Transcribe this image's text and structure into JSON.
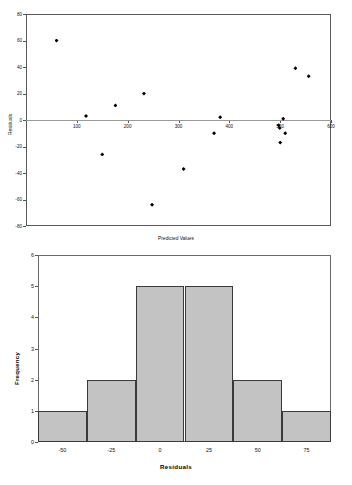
{
  "chart_data": [
    {
      "type": "scatter",
      "title": "",
      "xlabel": "Predicted Values",
      "ylabel": "Residuals",
      "xlim": [
        0,
        600
      ],
      "ylim": [
        -80,
        80
      ],
      "xticks": [
        0,
        100,
        200,
        300,
        400,
        500,
        600
      ],
      "xticklabels": [
        "",
        "100",
        "200",
        "300",
        "400",
        "500",
        "600"
      ],
      "yticks": [
        -80,
        -60,
        -40,
        -20,
        0,
        20,
        40,
        60,
        80
      ],
      "yticklabels": [
        "-80",
        "-60",
        "-40",
        "-20",
        "0",
        "20",
        "40",
        "60",
        "80"
      ],
      "grid": false,
      "legend": "none",
      "marker": "diamond",
      "zero_reference_line": true,
      "points": [
        {
          "x": 60,
          "y": 60
        },
        {
          "x": 118,
          "y": 3
        },
        {
          "x": 150,
          "y": -26
        },
        {
          "x": 176,
          "y": 11
        },
        {
          "x": 232,
          "y": 20
        },
        {
          "x": 248,
          "y": -64
        },
        {
          "x": 310,
          "y": -37
        },
        {
          "x": 370,
          "y": -10
        },
        {
          "x": 382,
          "y": 2
        },
        {
          "x": 497,
          "y": -4
        },
        {
          "x": 499,
          "y": -6
        },
        {
          "x": 506,
          "y": 1
        },
        {
          "x": 500,
          "y": -17
        },
        {
          "x": 510,
          "y": -10
        },
        {
          "x": 530,
          "y": 39
        },
        {
          "x": 556,
          "y": 33
        }
      ]
    },
    {
      "type": "bar",
      "title": "",
      "xlabel": "Residuals",
      "ylabel": "Frequency",
      "categories": [
        "-50",
        "-25",
        "0",
        "25",
        "50",
        "75"
      ],
      "values": [
        1,
        2,
        5,
        5,
        2,
        1
      ],
      "xticks": [
        "-50",
        "-25",
        "0",
        "25",
        "50",
        "75"
      ],
      "yticks": [
        0,
        1,
        2,
        3,
        4,
        5,
        6
      ],
      "ylim": [
        0,
        6
      ],
      "grid": false,
      "legend": "none",
      "bar_fill": "#c3c3c3",
      "bar_edge": "#3a3a3a"
    }
  ],
  "scatter": {
    "x_axis_title": "Predicted Values",
    "y_axis_title": "Residuals",
    "xticklabels": [
      "",
      "100",
      "200",
      "300",
      "400",
      "500",
      "600"
    ],
    "yticklabels": [
      "80",
      "60",
      "40",
      "20",
      "0",
      "-20",
      "-40",
      "-60",
      "-80"
    ]
  },
  "histogram": {
    "x_axis_title": "Residuals",
    "y_axis_title": "Frequency",
    "xticklabels": [
      "-50",
      "-25",
      "0",
      "25",
      "50",
      "75"
    ],
    "yticklabels": [
      "6",
      "5",
      "4",
      "3",
      "2",
      "1",
      "0"
    ]
  }
}
